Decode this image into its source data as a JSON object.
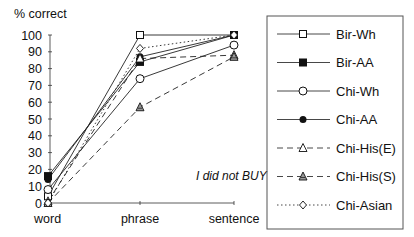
{
  "chart_data": {
    "type": "line",
    "title": "",
    "ylabel": "% correct",
    "xlabel": "",
    "ylim": [
      0,
      100
    ],
    "yticks": [
      0,
      10,
      20,
      30,
      40,
      50,
      60,
      70,
      80,
      90,
      100
    ],
    "categories": [
      "word",
      "phrase",
      "sentence"
    ],
    "annotation": "I did not BUY",
    "legend_position": "right",
    "grid": false,
    "series": [
      {
        "name": "Bir-Wh",
        "marker": "square-open",
        "line": "solid",
        "values": [
          4,
          100,
          100
        ]
      },
      {
        "name": "Bir-AA",
        "marker": "square-filled",
        "line": "solid",
        "values": [
          16,
          84,
          100
        ]
      },
      {
        "name": "Chi-Wh",
        "marker": "circle-open",
        "line": "solid",
        "values": [
          8,
          74,
          94
        ]
      },
      {
        "name": "Chi-AA",
        "marker": "circle-filled",
        "line": "solid",
        "values": [
          14,
          87,
          100
        ]
      },
      {
        "name": "Chi-His(E)",
        "marker": "triangle-open",
        "line": "dashed",
        "values": [
          1,
          86,
          88
        ]
      },
      {
        "name": "Chi-His(S)",
        "marker": "triangle-hatched",
        "line": "dashed",
        "values": [
          0,
          57,
          87
        ]
      },
      {
        "name": "Chi-Asian",
        "marker": "diamond-open",
        "line": "dotted",
        "values": [
          0,
          92,
          100
        ]
      }
    ]
  },
  "axis": {
    "ylabel": "% correct",
    "yticks": [
      "0",
      "10",
      "20",
      "30",
      "40",
      "50",
      "60",
      "70",
      "80",
      "90",
      "100"
    ],
    "xticks": [
      "word",
      "phrase",
      "sentence"
    ]
  },
  "annotation": "I did not BUY",
  "legend": [
    "Bir-Wh",
    "Bir-AA",
    "Chi-Wh",
    "Chi-AA",
    "Chi-His(E)",
    "Chi-His(S)",
    "Chi-Asian"
  ]
}
